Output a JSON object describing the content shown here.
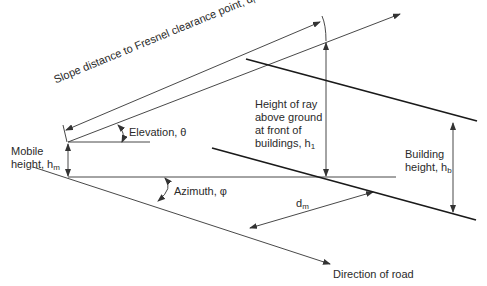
{
  "diagram": {
    "labels": {
      "slope_distance": "Slope distance to Fresnel clearance point, d",
      "slope_distance_sub": "r",
      "elevation": "Elevation, θ",
      "mobile_height_line1": "Mobile",
      "mobile_height_line2": "height, h",
      "mobile_height_sub": "m",
      "ray_height_line1": "Height of ray",
      "ray_height_line2": "above ground",
      "ray_height_line3": "at front of",
      "ray_height_line4": "buildings, h",
      "ray_height_sub": "1",
      "building_height_line1": "Building",
      "building_height_line2": "height, h",
      "building_height_sub": "b",
      "azimuth": "Azimuth, φ",
      "distance_label": "d",
      "distance_sub": "m",
      "road_direction": "Direction of road"
    },
    "colors": {
      "line": "#333333",
      "thick_line": "#1a1a1a",
      "text": "#2a2a2a",
      "background": "#ffffff"
    }
  }
}
